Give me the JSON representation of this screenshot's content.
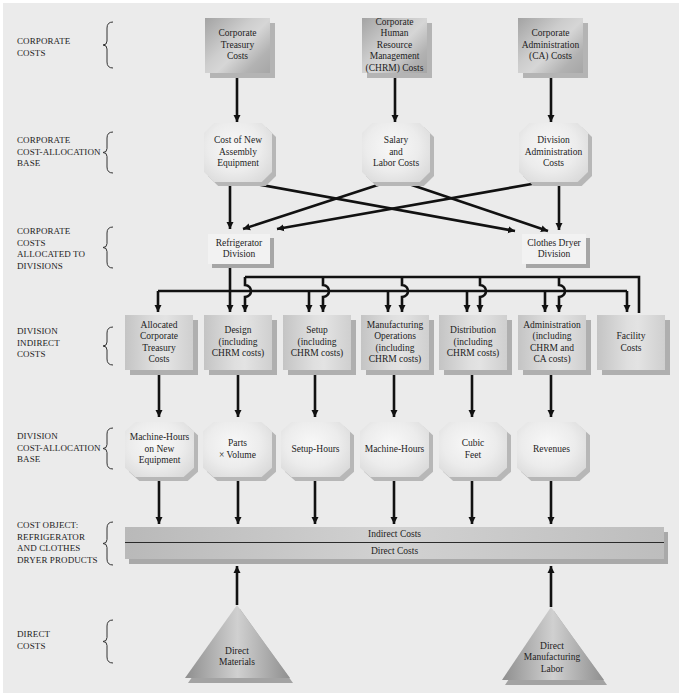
{
  "row_labels": [
    {
      "label": "CORPORATE\nCOSTS"
    },
    {
      "label": "CORPORATE\nCOST-ALLOCATION\nBASE"
    },
    {
      "label": "CORPORATE\nCOSTS\nALLOCATED TO\nDIVISIONS"
    },
    {
      "label": "DIVISION\nINDIRECT\nCOSTS"
    },
    {
      "label": "DIVISION\nCOST-ALLOCATION\nBASE"
    },
    {
      "label": "COST OBJECT:\nREFRIGERATOR\nAND CLOTHES\nDRYER PRODUCTS"
    },
    {
      "label": "DIRECT\nCOSTS"
    }
  ],
  "corporate_costs": [
    {
      "label": "Corporate\nTreasury\nCosts"
    },
    {
      "label": "Corporate\nHuman Resource\nManagement\n(CHRM) Costs"
    },
    {
      "label": "Corporate\nAdministration\n(CA) Costs"
    }
  ],
  "corporate_allocation_bases": [
    {
      "label": "Cost of New\nAssembly\nEquipment"
    },
    {
      "label": "Salary\nand\nLabor Costs"
    },
    {
      "label": "Division\nAdministration\nCosts"
    }
  ],
  "divisions": [
    {
      "label": "Refrigerator\nDivision"
    },
    {
      "label": "Clothes Dryer\nDivision"
    }
  ],
  "division_indirect_costs": [
    {
      "label": "Allocated\nCorporate\nTreasury\nCosts"
    },
    {
      "label": "Design\n(including\nCHRM costs)"
    },
    {
      "label": "Setup\n(including\nCHRM costs)"
    },
    {
      "label": "Manufacturing\nOperations\n(including\nCHRM costs)"
    },
    {
      "label": "Distribution\n(including\nCHRM costs)"
    },
    {
      "label": "Administration\n(including\nCHRM and\nCA costs)"
    },
    {
      "label": "Facility\nCosts"
    }
  ],
  "division_allocation_bases": [
    {
      "label": "Machine-Hours\non New\nEquipment"
    },
    {
      "label": "Parts\n× Volume"
    },
    {
      "label": "Setup-Hours"
    },
    {
      "label": "Machine-Hours"
    },
    {
      "label": "Cubic\nFeet"
    },
    {
      "label": "Revenues"
    }
  ],
  "cost_object": {
    "indirect": "Indirect Costs",
    "direct": "Direct Costs"
  },
  "direct_costs": [
    {
      "label": "Direct\nMaterials"
    },
    {
      "label": "Direct\nManufacturing\nLabor"
    }
  ],
  "colors": {
    "panel_background": "#ebebeb",
    "arrow": "#111111",
    "corporate_box": "#c0c0c0",
    "indirect_box": "#d8d8d8",
    "octagon": "#ececec",
    "shadow": "#b0b0b0"
  }
}
